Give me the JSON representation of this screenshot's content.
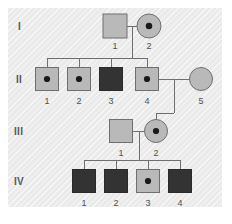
{
  "figure": {
    "kind": "pedigree-chart",
    "panel": {
      "background_color": "#ededed",
      "x": 8,
      "y": 8,
      "width": 214,
      "height": 199
    },
    "legend_colors": {
      "unaffected_fill": "#b9b9b9",
      "carrier_fill": "#b9b9b9",
      "carrier_dot": "#1a1a1a",
      "affected_fill": "#333333",
      "symbol_stroke": "#6f6f6f",
      "affected_stroke": "#2a2a2a",
      "line_color": "#6f6f6f",
      "label_color": "#4a4f54",
      "generation_label_color": "#555b60"
    }
  },
  "generations": [
    {
      "label": "I",
      "y": 26,
      "label_x": 18,
      "label_y": 21
    },
    {
      "label": "II",
      "y": 79,
      "label_x": 16,
      "label_y": 74
    },
    {
      "label": "III",
      "y": 131,
      "label_x": 14,
      "label_y": 126
    },
    {
      "label": "IV",
      "y": 181,
      "label_x": 14,
      "label_y": 176
    }
  ],
  "individuals": [
    {
      "id": "I-1",
      "number": "1",
      "generation": "I",
      "sex": "male",
      "status": "unaffected",
      "cx": 115,
      "cy": 26,
      "size": 24,
      "label_y": 41
    },
    {
      "id": "I-2",
      "number": "2",
      "generation": "I",
      "sex": "female",
      "status": "carrier",
      "cx": 149,
      "cy": 26,
      "size": 24,
      "label_y": 41
    },
    {
      "id": "II-1",
      "number": "1",
      "generation": "II",
      "sex": "male",
      "status": "carrier",
      "cx": 47,
      "cy": 79,
      "size": 23,
      "label_y": 96
    },
    {
      "id": "II-2",
      "number": "2",
      "generation": "II",
      "sex": "male",
      "status": "carrier",
      "cx": 79,
      "cy": 79,
      "size": 23,
      "label_y": 96
    },
    {
      "id": "II-3",
      "number": "3",
      "generation": "II",
      "sex": "male",
      "status": "affected",
      "cx": 111,
      "cy": 79,
      "size": 23,
      "label_y": 96
    },
    {
      "id": "II-4",
      "number": "4",
      "generation": "II",
      "sex": "male",
      "status": "carrier",
      "cx": 147,
      "cy": 79,
      "size": 23,
      "label_y": 96
    },
    {
      "id": "II-5",
      "number": "5",
      "generation": "II",
      "sex": "female",
      "status": "unaffected",
      "cx": 201,
      "cy": 79,
      "size": 23,
      "label_y": 96
    },
    {
      "id": "III-1",
      "number": "1",
      "generation": "III",
      "sex": "male",
      "status": "unaffected",
      "cx": 121,
      "cy": 131,
      "size": 23,
      "label_y": 148
    },
    {
      "id": "III-2",
      "number": "2",
      "generation": "III",
      "sex": "female",
      "status": "carrier",
      "cx": 156,
      "cy": 131,
      "size": 23,
      "label_y": 148
    },
    {
      "id": "IV-1",
      "number": "1",
      "generation": "IV",
      "sex": "male",
      "status": "affected",
      "cx": 84,
      "cy": 181,
      "size": 23,
      "label_y": 198
    },
    {
      "id": "IV-2",
      "number": "2",
      "generation": "IV",
      "sex": "male",
      "status": "affected",
      "cx": 116,
      "cy": 181,
      "size": 23,
      "label_y": 198
    },
    {
      "id": "IV-3",
      "number": "3",
      "generation": "IV",
      "sex": "male",
      "status": "carrier",
      "cx": 148,
      "cy": 181,
      "size": 23,
      "label_y": 198
    },
    {
      "id": "IV-4",
      "number": "4",
      "generation": "IV",
      "sex": "male",
      "status": "affected",
      "cx": 180,
      "cy": 181,
      "size": 23,
      "label_y": 198
    }
  ],
  "matings": [
    {
      "id": "mating-I",
      "partners": [
        "I-1",
        "I-2"
      ],
      "line": {
        "x1": 127,
        "y1": 26,
        "x2": 137,
        "y2": 26
      },
      "drop": {
        "x": 132,
        "y1": 26,
        "y2": 58
      }
    },
    {
      "id": "mating-II",
      "partners": [
        "II-4",
        "II-5"
      ],
      "line": {
        "x1": 159,
        "y1": 79,
        "x2": 189,
        "y2": 79
      },
      "drop": {
        "x": 174,
        "y1": 79,
        "y2": 113
      }
    },
    {
      "id": "mating-III",
      "partners": [
        "III-1",
        "III-2"
      ],
      "line": {
        "x1": 133,
        "y1": 131,
        "x2": 144,
        "y2": 131
      },
      "drop": {
        "x": 139,
        "y1": 131,
        "y2": 160
      }
    }
  ],
  "sibships": [
    {
      "id": "sibship-II",
      "parents": "mating-I",
      "bar": {
        "y": 58,
        "x1": 47,
        "x2": 147
      },
      "drops": [
        {
          "x": 47,
          "y1": 58,
          "y2": 68
        },
        {
          "x": 79,
          "y1": 58,
          "y2": 68
        },
        {
          "x": 111,
          "y1": 58,
          "y2": 68
        },
        {
          "x": 147,
          "y1": 58,
          "y2": 68
        }
      ]
    },
    {
      "id": "sibship-III",
      "parents": "mating-II",
      "bar": {
        "y": 113,
        "x1": 156,
        "x2": 174
      },
      "drops": [
        {
          "x": 156,
          "y1": 113,
          "y2": 120
        }
      ]
    },
    {
      "id": "sibship-IV",
      "parents": "mating-III",
      "bar": {
        "y": 160,
        "x1": 84,
        "x2": 180
      },
      "drops": [
        {
          "x": 84,
          "y1": 160,
          "y2": 170
        },
        {
          "x": 116,
          "y1": 160,
          "y2": 170
        },
        {
          "x": 148,
          "y1": 160,
          "y2": 170
        },
        {
          "x": 180,
          "y1": 160,
          "y2": 170
        }
      ]
    }
  ]
}
